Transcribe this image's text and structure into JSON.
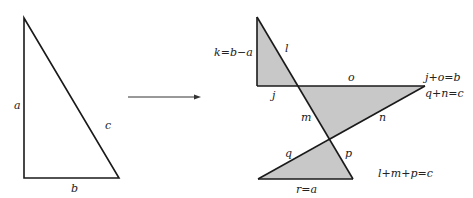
{
  "colors": {
    "stroke": "#1a1a1a",
    "fill": "#c8c8c8",
    "background": "#ffffff"
  },
  "left_triangle": {
    "labels": {
      "a": "a",
      "b": "b",
      "c": "c"
    }
  },
  "arrow": {
    "direction": "right"
  },
  "right_figure": {
    "labels": {
      "k": "k=b−a",
      "l": "l",
      "j": "j",
      "o": "o",
      "m": "m",
      "n": "n",
      "q": "q",
      "p": "p",
      "r": "r=a"
    },
    "equations": {
      "eq1": "j+o=b",
      "eq2": "q+n=c",
      "eq3": "l+m+p=c"
    }
  }
}
